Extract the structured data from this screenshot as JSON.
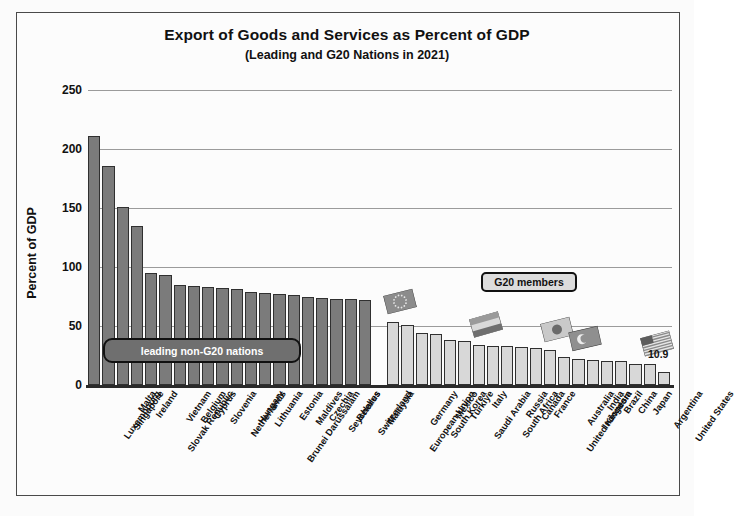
{
  "chart_data": {
    "type": "bar",
    "title": "Export of Goods and Services as Percent of GDP",
    "subtitle": "(Leading and G20 Nations in 2021)",
    "xlabel": "",
    "ylabel": "Percent of GDP",
    "ylim": [
      0,
      250
    ],
    "yticks": [
      0,
      50,
      100,
      150,
      200,
      250
    ],
    "grid": true,
    "legend_position": "none",
    "categories": [
      "Luxembourg",
      "Singapore",
      "Malta",
      "Ireland",
      "Slovak Republic",
      "Vietnam",
      "Belgium",
      "Cyprus",
      "Slovenia",
      "Netherlands",
      "Hungary",
      "Lithuania",
      "Brunei Darussalam",
      "Estonia",
      "Maldives",
      "Czechia",
      "Seychelles",
      "Belarus",
      "Switzerland",
      "Malaysia",
      "European Union",
      "Germany",
      "South Korea",
      "Mexico",
      "Türkiye",
      "Saudi Arabia",
      "Italy",
      "South Africa",
      "Russia",
      "Canada",
      "France",
      "United Kingdom",
      "Australia",
      "Indonesia",
      "India",
      "Brazil",
      "China",
      "Japan",
      "Argentina",
      "United States"
    ],
    "values": [
      211,
      186,
      151,
      135,
      95,
      93,
      85,
      84,
      83,
      82,
      81,
      79,
      78,
      77,
      76,
      75,
      74,
      73,
      73,
      72,
      53,
      51,
      44,
      43,
      38,
      37,
      34,
      33,
      33,
      32,
      31,
      30,
      24,
      22,
      21,
      20,
      20,
      18,
      18,
      10.9
    ],
    "groups": [
      {
        "name": "leading non-G20 nations",
        "start": 0,
        "end": 19,
        "color": "#7b7b7b"
      },
      {
        "name": "G20 members",
        "start": 20,
        "end": 39,
        "color": "#d8d8d8"
      }
    ],
    "annotations": [
      {
        "text": "leading non-G20 nations",
        "style": "dark-rounded"
      },
      {
        "text": "G20 members",
        "style": "light-box"
      },
      {
        "text": "10.9",
        "style": "value-label",
        "series_index": 39
      }
    ]
  },
  "labels": {
    "y0": "0",
    "y50": "50",
    "y100": "100",
    "y150": "150",
    "y200": "200",
    "y250": "250",
    "axis_title": "Percent of GDP",
    "us_value": "10.9",
    "group_left": "leading non-G20 nations",
    "group_right": "G20 members"
  }
}
